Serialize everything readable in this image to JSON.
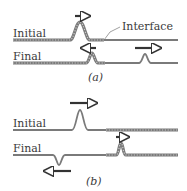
{
  "figure": {
    "panel_a": {
      "caption": "(a)",
      "initial_label": "Initial",
      "final_label": "Final",
      "interface_label": "Interface",
      "left_rope": "heavy",
      "right_rope": "light",
      "initial_pulse": {
        "direction": "right",
        "orientation": "upright"
      },
      "final_reflected_pulse": {
        "direction": "left",
        "orientation": "upright"
      },
      "final_transmitted_pulse": {
        "direction": "right",
        "orientation": "upright"
      }
    },
    "panel_b": {
      "caption": "(b)",
      "initial_label": "Initial",
      "final_label": "Final",
      "left_rope": "light",
      "right_rope": "heavy",
      "initial_pulse": {
        "direction": "right",
        "orientation": "upright"
      },
      "final_reflected_pulse": {
        "direction": "left",
        "orientation": "inverted"
      },
      "final_transmitted_pulse": {
        "direction": "right",
        "orientation": "upright"
      }
    },
    "colors": {
      "rope": "#7a7a7a",
      "heavy_rope_dots": "#bdbdbd",
      "arrow": "#333333",
      "text": "#3a3a3a"
    }
  }
}
